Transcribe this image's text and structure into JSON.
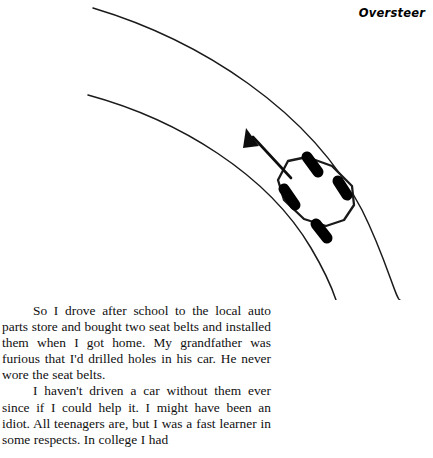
{
  "page": {
    "running_header": "Oversteer",
    "background_color": "#ffffff",
    "ink_color": "#101010"
  },
  "illustration": {
    "name": "car-oversteer-diagram",
    "description": "Overhead view of a car rotated sideways while travelling through a curving road, with an arrow indicating the intended direction of travel",
    "stroke_color": "#1a1a1a",
    "wheel_color": "#000000",
    "road": {
      "outer_edge_label": "outer road edge",
      "inner_edge_label": "inner road edge"
    },
    "arrow_label": "intended-direction-arrow",
    "car_label": "car-body",
    "wheels": [
      "front-left-wheel",
      "front-right-wheel",
      "rear-left-wheel",
      "rear-right-wheel"
    ]
  },
  "text": {
    "paragraphs": [
      "So I drove after school to the local auto parts store and bought two seat belts and installed them when I got home. My grandfather was furious that I'd drilled holes in his car. He never wore the seat belts.",
      "I haven't driven a car without them ever since if I could help it. I might have been an idiot. All teenagers are, but I was a fast learner in some respects. In college I had"
    ]
  }
}
